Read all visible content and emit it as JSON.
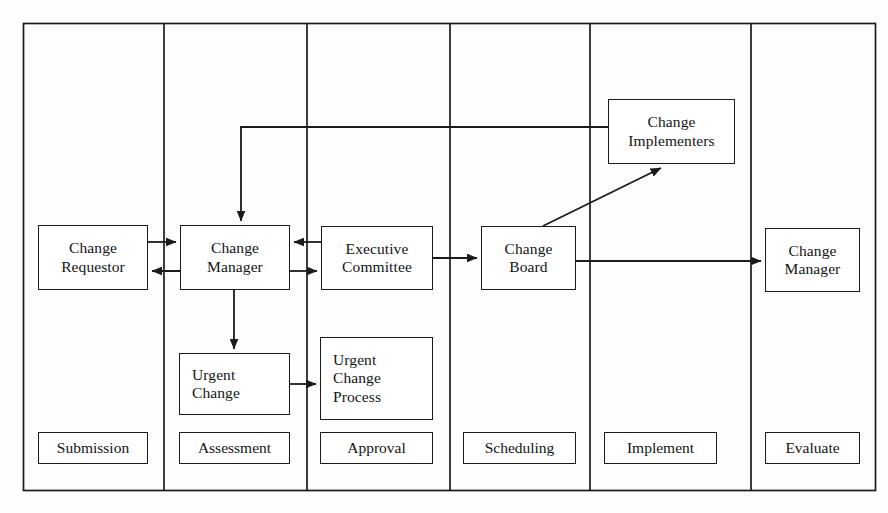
{
  "diagram": {
    "type": "swimlane-flowchart",
    "stroke_color": "#1b1b1b",
    "fill_color": "#ffffff",
    "background_color": "#fdfdfc",
    "lanes": [
      {
        "id": "submission",
        "label": "Submission"
      },
      {
        "id": "assessment",
        "label": "Assessment"
      },
      {
        "id": "approval",
        "label": "Approval"
      },
      {
        "id": "scheduling",
        "label": "Scheduling"
      },
      {
        "id": "implement",
        "label": "Implement"
      },
      {
        "id": "evaluate",
        "label": "Evaluate"
      }
    ],
    "nodes": [
      {
        "id": "change-requestor",
        "lane": "submission",
        "lines": [
          "Change",
          "Requestor"
        ]
      },
      {
        "id": "change-manager",
        "lane": "assessment",
        "lines": [
          "Change",
          "Manager"
        ]
      },
      {
        "id": "urgent-change",
        "lane": "assessment",
        "lines": [
          "Urgent",
          "Change"
        ]
      },
      {
        "id": "executive-committee",
        "lane": "approval",
        "lines": [
          "Executive",
          "Committee"
        ]
      },
      {
        "id": "urgent-change-process",
        "lane": "approval",
        "lines": [
          "Urgent",
          "Change",
          "Process"
        ]
      },
      {
        "id": "change-board",
        "lane": "scheduling",
        "lines": [
          "Change",
          "Board"
        ]
      },
      {
        "id": "change-implementers",
        "lane": "implement",
        "lines": [
          "Change",
          "Implementers"
        ]
      },
      {
        "id": "change-manager-evaluate",
        "lane": "evaluate",
        "lines": [
          "Change",
          "Manager"
        ]
      }
    ],
    "connections": [
      {
        "from": "change-requestor",
        "to": "change-manager",
        "style": "arrow"
      },
      {
        "from": "change-manager",
        "to": "change-requestor",
        "style": "arrow"
      },
      {
        "from": "executive-committee",
        "to": "change-manager",
        "style": "arrow"
      },
      {
        "from": "change-manager",
        "to": "executive-committee",
        "style": "arrow"
      },
      {
        "from": "change-manager",
        "to": "urgent-change",
        "style": "arrow"
      },
      {
        "from": "urgent-change",
        "to": "urgent-change-process",
        "style": "arrow"
      },
      {
        "from": "executive-committee",
        "to": "change-board",
        "style": "arrow"
      },
      {
        "from": "change-board",
        "to": "change-implementers",
        "style": "arrow-diagonal"
      },
      {
        "from": "change-board",
        "to": "change-manager-evaluate",
        "style": "arrow"
      },
      {
        "from": "change-implementers",
        "to": "change-manager",
        "style": "arrow-feedback"
      }
    ]
  }
}
